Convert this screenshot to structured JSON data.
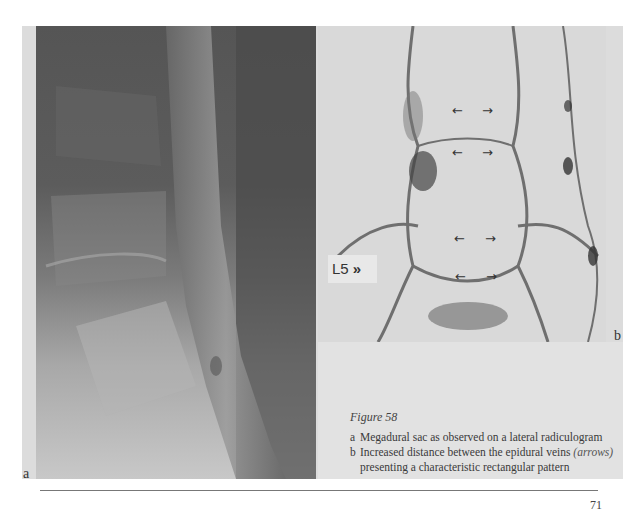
{
  "figure": {
    "title": "Figure 58",
    "panels": [
      {
        "label": "a",
        "description": "Lateral radiculogram (megadural sac)"
      },
      {
        "label": "b",
        "description": "Epidural venogram with arrows",
        "vertebra_label": "L5",
        "vertebra_marker": "»"
      }
    ],
    "captions": [
      {
        "marker": "a",
        "text": "Megadural sac as observed on a lateral radiculogram"
      },
      {
        "marker": "b",
        "text_before": "Increased distance between the epidural veins ",
        "text_italic": "(arrows)"
      },
      {
        "marker": "",
        "text": "presenting a characteristic rectangular pattern"
      }
    ],
    "arrows": {
      "left": "←",
      "right": "→"
    }
  },
  "page": {
    "number": "71"
  }
}
